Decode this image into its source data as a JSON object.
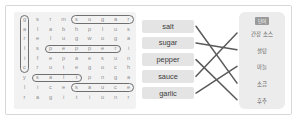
{
  "puzzle": {
    "grid": [
      [
        "g",
        "s",
        "r",
        "m",
        "s",
        "u",
        "g",
        "a",
        "r"
      ],
      [
        "a",
        "l",
        "a",
        "b",
        "h",
        "p",
        "l",
        "u",
        "s"
      ],
      [
        "r",
        "e",
        "l",
        "u",
        "g",
        "w",
        "o",
        "g",
        "a"
      ],
      [
        "l",
        "s",
        "p",
        "e",
        "p",
        "p",
        "e",
        "r",
        "i"
      ],
      [
        "i",
        "f",
        "e",
        "p",
        "a",
        "e",
        "s",
        "u",
        "n"
      ],
      [
        "c",
        "r",
        "u",
        "t",
        "e",
        "g",
        "o",
        "c",
        "h"
      ],
      [
        "y",
        "s",
        "a",
        "l",
        "t",
        "p",
        "n",
        "g",
        "a"
      ],
      [
        "l",
        "i",
        "c",
        "e",
        "s",
        "a",
        "u",
        "c",
        "e"
      ],
      [
        "r",
        "a",
        "g",
        "i",
        "t",
        "i",
        "o",
        "n",
        "r"
      ]
    ],
    "found_words": [
      {
        "word": "sugar",
        "orientation": "horizontal",
        "row": 0,
        "col_start": 4,
        "col_end": 8
      },
      {
        "word": "pepper",
        "orientation": "horizontal",
        "row": 3,
        "col_start": 2,
        "col_end": 7
      },
      {
        "word": "salt",
        "orientation": "horizontal",
        "row": 6,
        "col_start": 1,
        "col_end": 4
      },
      {
        "word": "sauce",
        "orientation": "horizontal",
        "row": 7,
        "col_start": 4,
        "col_end": 8
      },
      {
        "word": "garlic",
        "orientation": "vertical",
        "col": 0,
        "row_start": 0,
        "row_end": 5
      }
    ],
    "highlight_color": "#6f6f6f",
    "background_color": "#f2f2f2",
    "letter_color": "#8e8e8e"
  },
  "matching": {
    "words": [
      {
        "label": "salt"
      },
      {
        "label": "sugar"
      },
      {
        "label": "pepper"
      },
      {
        "label": "sauce"
      },
      {
        "label": "garlic"
      }
    ],
    "answer_header": "단어",
    "answers": [
      {
        "label": "간장 소스"
      },
      {
        "label": "설탕"
      },
      {
        "label": "마늘"
      },
      {
        "label": "소금"
      },
      {
        "label": "후추"
      }
    ],
    "connections": [
      {
        "from_word": 0,
        "to_answer": 3
      },
      {
        "from_word": 1,
        "to_answer": 1
      },
      {
        "from_word": 2,
        "to_answer": 4
      },
      {
        "from_word": 3,
        "to_answer": 0
      },
      {
        "from_word": 4,
        "to_answer": 2
      }
    ],
    "pill_color": "#e4e4e4",
    "answer_panel_color": "#ececec",
    "line_color": "#5a5a5a"
  }
}
